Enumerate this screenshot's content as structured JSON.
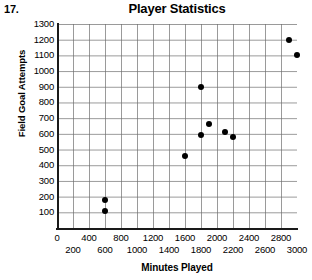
{
  "problem_number": "17.",
  "chart_data": {
    "type": "scatter",
    "title": "Player Statistics",
    "xlabel": "Minutes Played",
    "ylabel": "Field Goal Attempts",
    "xlim": [
      0,
      3000
    ],
    "ylim": [
      0,
      1300
    ],
    "grid": true,
    "legend": "none",
    "x_ticks": [
      0,
      200,
      400,
      600,
      800,
      1000,
      1200,
      1400,
      1600,
      1800,
      2000,
      2200,
      2400,
      2600,
      2800,
      3000
    ],
    "x_tick_labels": [
      "0",
      "200",
      "400",
      "600",
      "800",
      "1000",
      "1200",
      "1400",
      "1600",
      "1800",
      "2000",
      "2200",
      "2400",
      "2600",
      "2800",
      "3000"
    ],
    "y_ticks": [
      0,
      100,
      200,
      300,
      400,
      500,
      600,
      700,
      800,
      900,
      1000,
      1100,
      1200,
      1300
    ],
    "y_tick_labels": [
      "0",
      "100",
      "200",
      "300",
      "400",
      "500",
      "600",
      "700",
      "800",
      "900",
      "1000",
      "1100",
      "1200",
      "1300"
    ],
    "points": [
      {
        "x": 600,
        "y": 180
      },
      {
        "x": 600,
        "y": 110
      },
      {
        "x": 1600,
        "y": 460
      },
      {
        "x": 1800,
        "y": 590
      },
      {
        "x": 1800,
        "y": 900
      },
      {
        "x": 1900,
        "y": 660
      },
      {
        "x": 2100,
        "y": 610
      },
      {
        "x": 2200,
        "y": 580
      },
      {
        "x": 2900,
        "y": 1200
      },
      {
        "x": 3000,
        "y": 1100
      }
    ]
  }
}
